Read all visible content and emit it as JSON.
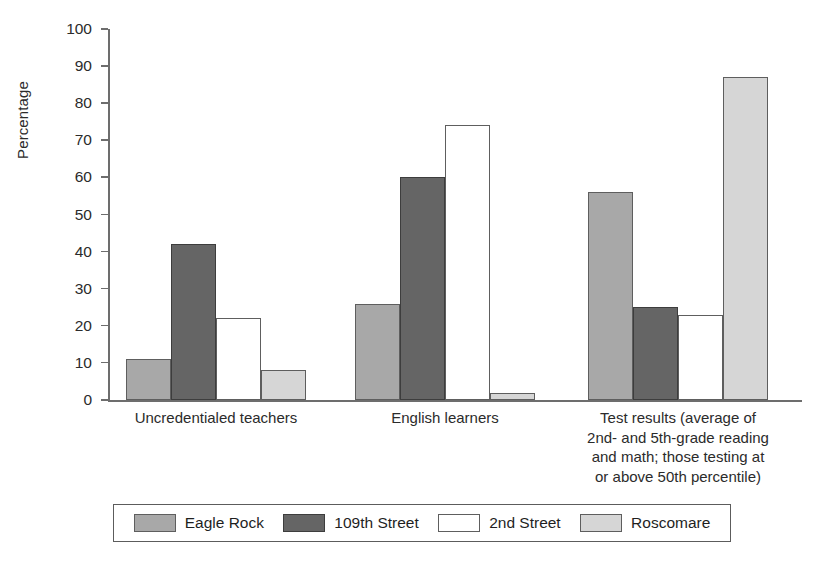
{
  "chart_data": {
    "type": "bar",
    "title": "",
    "subtitle": "",
    "xlabel": "",
    "ylabel": "Percentage",
    "ylim": [
      0,
      100
    ],
    "ytick_step": 10,
    "yticks": [
      100,
      90,
      80,
      70,
      60,
      50,
      40,
      30,
      20,
      10,
      0
    ],
    "grid": false,
    "legend_position": "bottom",
    "categories": [
      "Uncredentialed teachers",
      "English learners",
      "Test results (average of\n2nd- and 5th-grade reading\nand math; those testing at\nor above 50th percentile)"
    ],
    "series": [
      {
        "name": "Eagle Rock",
        "color": "#a8a8a8",
        "values": [
          11,
          26,
          56
        ]
      },
      {
        "name": "109th Street",
        "color": "#656565",
        "values": [
          42,
          60,
          25
        ]
      },
      {
        "name": "2nd Street",
        "color": "#ffffff",
        "values": [
          22,
          74,
          23
        ]
      },
      {
        "name": "Roscomare",
        "color": "#d6d6d6",
        "values": [
          8,
          2,
          87
        ]
      }
    ]
  },
  "axis": {
    "y_title": "Percentage"
  },
  "legend": {
    "entries": [
      {
        "label": "Eagle Rock"
      },
      {
        "label": "109th Street"
      },
      {
        "label": "2nd Street"
      },
      {
        "label": "Roscomare"
      }
    ]
  }
}
